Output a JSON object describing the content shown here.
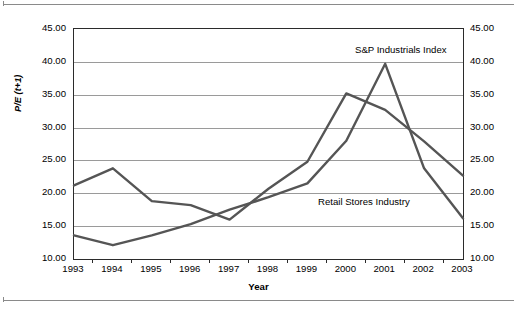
{
  "figure": {
    "axis_title_x": "Year",
    "axis_title_y": "P/E (t+1)",
    "y_tick_labels": [
      "45.00",
      "40.00",
      "35.00",
      "30.00",
      "25.00",
      "20.00",
      "15.00",
      "10.00"
    ],
    "x_tick_labels": [
      "1993",
      "1994",
      "1995",
      "1996",
      "1997",
      "1998",
      "1999",
      "2000",
      "2001",
      "2002",
      "2003"
    ],
    "annotation_sp": "S&P Industrials Index",
    "annotation_retail": "Retail Stores Industry"
  },
  "chart_data": {
    "type": "line",
    "title": "",
    "subtitle": "",
    "xlabel": "Year",
    "ylabel": "P/E (t+1)",
    "x": [
      1993,
      1994,
      1995,
      1996,
      1997,
      1998,
      1999,
      2000,
      2001,
      2002,
      2003
    ],
    "categories": [
      "1993",
      "1994",
      "1995",
      "1996",
      "1997",
      "1998",
      "1999",
      "2000",
      "2001",
      "2002",
      "2003"
    ],
    "xlim": [
      1993,
      2003
    ],
    "ylim": [
      10,
      45
    ],
    "y_ticks": [
      10,
      15,
      20,
      25,
      30,
      35,
      40,
      45
    ],
    "y_tick_format": "0.00",
    "grid": "horizontal",
    "dual_y_axis": true,
    "legend": "inline-annotations",
    "series": [
      {
        "name": "S&P Industrials Index",
        "color": "#555555",
        "values": [
          21.2,
          23.8,
          18.8,
          18.2,
          16.0,
          20.7,
          24.8,
          35.2,
          32.7,
          27.9,
          22.7
        ]
      },
      {
        "name": "Retail Stores Industry",
        "color": "#555555",
        "values": [
          13.6,
          12.1,
          13.6,
          15.3,
          17.5,
          19.4,
          21.5,
          28.0,
          39.7,
          23.8,
          16.2
        ]
      }
    ],
    "annotations": [
      {
        "text": "S&P Industrials Index",
        "x": 2001,
        "y": 41.5
      },
      {
        "text": "Retail Stores Industry",
        "x": 2000,
        "y": 18.7
      }
    ]
  }
}
